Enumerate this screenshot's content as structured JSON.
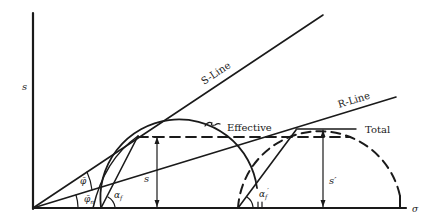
{
  "diagram": {
    "type": "mohr-circle-stress-diagram",
    "axes": {
      "y_label": "s",
      "x_label": "σ"
    },
    "lines": {
      "s_line_label": "S-Line",
      "r_line_label": "R-Line"
    },
    "circles": {
      "effective_label": "Effective",
      "total_label": "Total"
    },
    "dimensions": {
      "s_label": "s",
      "s_prime_label": "s′"
    },
    "angles": {
      "phi_bar": "φ̄",
      "phi_bar_n": "φ̄",
      "phi_bar_n_sub": "n",
      "alpha_f": "α",
      "alpha_f_sub": "f",
      "alpha_f_prime": "α",
      "alpha_f_prime_sub": "f",
      "prime_mark": "′"
    },
    "colors": {
      "ink": "#1a1a1a",
      "background": "#ffffff"
    }
  }
}
